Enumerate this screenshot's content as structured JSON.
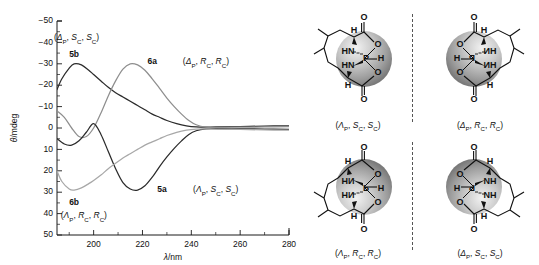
{
  "figure": {
    "panels": [
      "cd-spectra-plot",
      "molecular-structures"
    ]
  },
  "chart_data": {
    "type": "line",
    "title": "",
    "xlabel": "λ/nm",
    "ylabel": "θ/mdeg",
    "xlim": [
      185,
      280
    ],
    "ylim": [
      -50,
      50
    ],
    "xticks": [
      200,
      220,
      240,
      260,
      280
    ],
    "yticks": [
      -50,
      -40,
      -30,
      -20,
      -10,
      0,
      10,
      20,
      30,
      40,
      50
    ],
    "grid": false,
    "legend": "inline-annotations",
    "series": [
      {
        "name": "5b",
        "label": "5b",
        "descriptor": "(ΔP, SC, SC)",
        "color": "#2b2b2b",
        "x": [
          185,
          187,
          190,
          192,
          195,
          198,
          200,
          203,
          206,
          209,
          212,
          215,
          218,
          221,
          224,
          227,
          230,
          234,
          238,
          242,
          246,
          250,
          260,
          270,
          280
        ],
        "y": [
          18,
          23,
          28,
          30,
          29.5,
          27,
          25,
          22,
          19,
          16.5,
          14.5,
          12.5,
          10.5,
          8.5,
          6.5,
          5,
          3.5,
          2,
          1,
          0.5,
          0.4,
          0.5,
          0.7,
          0.9,
          1.0
        ]
      },
      {
        "name": "6a",
        "label": "6a",
        "descriptor": "(ΔP, RC, RC)",
        "color": "#8e8e8e",
        "x": [
          185,
          188,
          191,
          194,
          197,
          200,
          203,
          206,
          209,
          212,
          215,
          218,
          221,
          224,
          227,
          230,
          233,
          236,
          239,
          242,
          246,
          250,
          260,
          270,
          280
        ],
        "y": [
          8,
          5,
          0,
          -4,
          -4,
          0,
          7,
          15,
          22,
          27.5,
          30,
          29.5,
          27,
          23,
          18.5,
          14,
          10,
          6.5,
          3.5,
          1.5,
          0.4,
          0.3,
          0.4,
          0.5,
          0.6
        ]
      },
      {
        "name": "5a",
        "label": "5a",
        "descriptor": "(ΛP, SC, SC)",
        "color": "#2b2b2b",
        "x": [
          185,
          188,
          191,
          194,
          197,
          200,
          203,
          206,
          209,
          212,
          215,
          218,
          221,
          224,
          227,
          230,
          233,
          236,
          239,
          242,
          246,
          250,
          260,
          270,
          280
        ],
        "y": [
          -5,
          -7.5,
          -8,
          -6,
          -2,
          2,
          -3,
          -11,
          -19,
          -25.5,
          -28.5,
          -29,
          -27,
          -23,
          -18,
          -13.5,
          -9.5,
          -6,
          -3,
          -1.3,
          -0.4,
          -0.3,
          -0.4,
          -0.5,
          -0.6
        ]
      },
      {
        "name": "6b",
        "label": "6b",
        "descriptor": "(ΛP, RC, RC)",
        "color": "#a8a8a8",
        "x": [
          185,
          187,
          190,
          192,
          195,
          198,
          200,
          203,
          206,
          209,
          212,
          215,
          218,
          221,
          224,
          227,
          230,
          234,
          238,
          242,
          246,
          250,
          260,
          270,
          280
        ],
        "y": [
          -20,
          -25,
          -28.5,
          -29,
          -28,
          -26,
          -24.5,
          -22,
          -19,
          -16.5,
          -14,
          -12,
          -10,
          -8,
          -6.5,
          -5,
          -3.5,
          -2,
          -1,
          -0.5,
          -0.4,
          -0.5,
          -0.7,
          -0.9,
          -1.0
        ]
      }
    ],
    "annotations": [
      {
        "text": "(ΔP, SC, SC)",
        "x": 193,
        "y": 41
      },
      {
        "text": "5b",
        "x": 192,
        "y": 33
      },
      {
        "text": "6a",
        "x": 224,
        "y": 30
      },
      {
        "text": "(ΔP, RC, RC)",
        "x": 246,
        "y": 30
      },
      {
        "text": "5a",
        "x": 228,
        "y": -30
      },
      {
        "text": "(ΛP, SC, SC)",
        "x": 250,
        "y": -30
      },
      {
        "text": "6b",
        "x": 192,
        "y": -36
      },
      {
        "text": "(ΛP, RC, RC)",
        "x": 196,
        "y": -42
      }
    ]
  },
  "structures": [
    {
      "id": "struct-lambda-p-sc-sc",
      "caption": "(ΛP, SC, SC)",
      "chirality": {
        "p": "Λ",
        "c1": "S",
        "c2": "S"
      },
      "mirror": false,
      "position": "top-left",
      "atoms": [
        "O",
        "H",
        "HN",
        "HN",
        "P",
        "H",
        "O",
        "O",
        "O",
        "H"
      ]
    },
    {
      "id": "struct-delta-p-rc-rc",
      "caption": "(ΔP, RC, RC)",
      "chirality": {
        "p": "Δ",
        "c1": "R",
        "c2": "R"
      },
      "mirror": true,
      "position": "top-right",
      "atoms": [
        "O",
        "H",
        "NH",
        "NH",
        "P",
        "H",
        "O",
        "O",
        "O",
        "H"
      ]
    },
    {
      "id": "struct-lambda-p-rc-rc",
      "caption": "(ΛP, RC, RC)",
      "chirality": {
        "p": "Λ",
        "c1": "R",
        "c2": "R"
      },
      "mirror": false,
      "position": "bottom-left",
      "atoms": [
        "O",
        "H",
        "HN",
        "HN",
        "P",
        "H",
        "O",
        "O",
        "O",
        "H"
      ]
    },
    {
      "id": "struct-delta-p-sc-sc",
      "caption": "(ΔP, SC, SC)",
      "chirality": {
        "p": "Δ",
        "c1": "S",
        "c2": "S"
      },
      "mirror": true,
      "position": "bottom-right",
      "atoms": [
        "O",
        "H",
        "NH",
        "NH",
        "P",
        "H",
        "O",
        "O",
        "O",
        "H"
      ]
    }
  ],
  "axis": {
    "x_title": "λ/nm",
    "y_title": "θ/mdeg",
    "xticks": [
      "200",
      "220",
      "240",
      "260",
      "280"
    ],
    "yticks": [
      "50",
      "40",
      "30",
      "20",
      "10",
      "0",
      "−10",
      "−20",
      "−30",
      "−40",
      "−50"
    ]
  }
}
